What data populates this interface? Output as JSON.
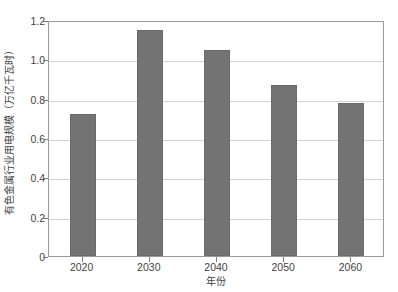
{
  "chart_data": {
    "type": "bar",
    "title": "",
    "subtitle": "",
    "xlabel": "年份",
    "ylabel": "有色金属行业用电规模（万亿千瓦时）",
    "categories": [
      "2020",
      "2030",
      "2040",
      "2050",
      "2060"
    ],
    "values": [
      0.72,
      1.15,
      1.05,
      0.87,
      0.78
    ],
    "series": [
      {
        "name": "有色金属行业用电规模",
        "values": [
          0.72,
          1.15,
          1.05,
          0.87,
          0.78
        ]
      }
    ],
    "ylim": [
      0,
      1.2
    ],
    "ytick_labels": [
      "0",
      "0.2",
      "0.4",
      "0.6",
      "0.8",
      "1.0",
      "1.2"
    ],
    "ytick_values": [
      0,
      0.2,
      0.4,
      0.6,
      0.8,
      1.0,
      1.2
    ],
    "xtick_labels": [
      "2020",
      "2030",
      "2040",
      "2050",
      "2060"
    ],
    "grid": true,
    "grid_axis": "y",
    "legend": false,
    "legend_position": "none",
    "bar_color": "#737373",
    "grid_color": "#d2d2d2",
    "frame_color": "#9a9a9a",
    "text_color": "#3f3f3f",
    "background_color": "#ffffff",
    "annotations": []
  }
}
